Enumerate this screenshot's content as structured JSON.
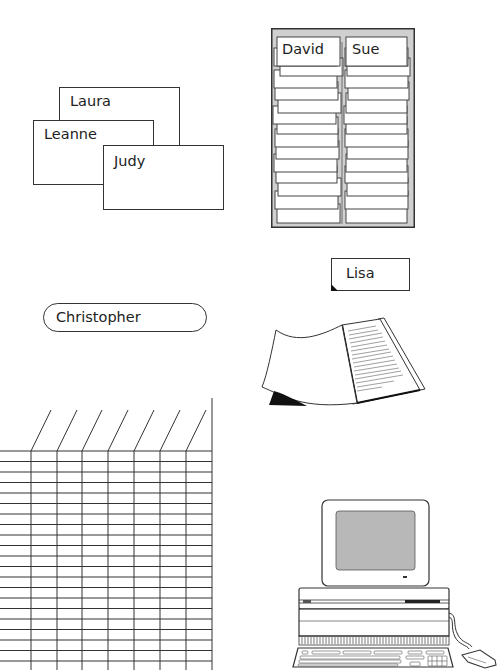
{
  "overlapping_cards": [
    {
      "name": "Laura"
    },
    {
      "name": "Leanne"
    },
    {
      "name": "Judy"
    }
  ],
  "card_file": {
    "column_labels": [
      "David",
      "Sue"
    ],
    "background_color": "#d0d0d0",
    "cards_per_column": 16
  },
  "tab_label": {
    "name": "Lisa"
  },
  "pill_label": {
    "name": "Christopher"
  },
  "spreadsheet": {
    "columns": 8,
    "rows": 21,
    "line_color": "#333333"
  },
  "document": {
    "type": "open-book-with-text-lines"
  },
  "computer": {
    "screen_color": "#b8b8b8",
    "parts": [
      "monitor",
      "system-unit",
      "keyboard",
      "mouse"
    ]
  }
}
